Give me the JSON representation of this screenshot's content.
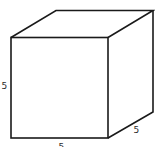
{
  "diagram": {
    "type": "cube",
    "stroke_color": "#1a1a1a",
    "background": "#ffffff",
    "labels": {
      "height": "5",
      "width": "5",
      "depth": "5"
    }
  }
}
